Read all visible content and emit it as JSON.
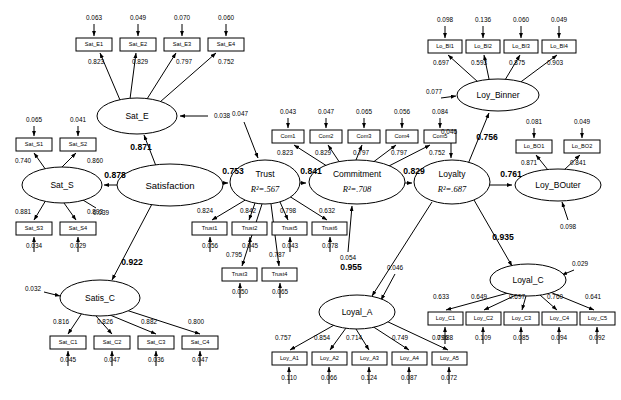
{
  "diagram": {
    "type": "sem-path-diagram",
    "title": "",
    "background_color": "#ffffff",
    "line_color": "#000000"
  },
  "latent_variables": [
    {
      "id": "Sat_E",
      "label": "Sat_E",
      "r2": "",
      "cx": 137,
      "cy": 116,
      "rx": 40,
      "ry": 18
    },
    {
      "id": "Sat_S",
      "label": "Sat_S",
      "r2": "",
      "cx": 62,
      "cy": 185,
      "rx": 40,
      "ry": 18
    },
    {
      "id": "Satisfaction",
      "label": "Satisfaction",
      "r2": "",
      "cx": 170,
      "cy": 185,
      "rx": 53,
      "ry": 21
    },
    {
      "id": "Satis_C",
      "label": "Satis_C",
      "r2": "",
      "cx": 100,
      "cy": 298,
      "rx": 40,
      "ry": 18
    },
    {
      "id": "Trust",
      "label": "Trust",
      "r2": "R²=.567",
      "cx": 265,
      "cy": 182,
      "rx": 35,
      "ry": 22
    },
    {
      "id": "Commitment",
      "label": "Commitment",
      "r2": "R²=.708",
      "cx": 357,
      "cy": 182,
      "rx": 48,
      "ry": 22
    },
    {
      "id": "Loyalty",
      "label": "Loyalty",
      "r2": "R²=.687",
      "cx": 452,
      "cy": 182,
      "rx": 38,
      "ry": 22
    },
    {
      "id": "Loy_Binner",
      "label": "Loy_Binner",
      "r2": "",
      "cx": 498,
      "cy": 95,
      "rx": 41,
      "ry": 16
    },
    {
      "id": "Loy_BOuter",
      "label": "Loy_BOuter",
      "r2": "",
      "cx": 558,
      "cy": 185,
      "rx": 43,
      "ry": 16
    },
    {
      "id": "Loyal_C",
      "label": "Loyal_C",
      "r2": "",
      "cx": 528,
      "cy": 280,
      "rx": 38,
      "ry": 16
    },
    {
      "id": "Loyal_A",
      "label": "Loyal_A",
      "r2": "",
      "cx": 357,
      "cy": 312,
      "rx": 38,
      "ry": 17
    }
  ],
  "measured_variables": [
    {
      "id": "Sat_E1",
      "label": "Sat_E1",
      "x": 76,
      "y": 38,
      "w": 36,
      "h": 13
    },
    {
      "id": "Sat_E2",
      "label": "Sat_E2",
      "x": 120,
      "y": 38,
      "w": 36,
      "h": 13
    },
    {
      "id": "Sat_E3",
      "label": "Sat_E3",
      "x": 164,
      "y": 38,
      "w": 36,
      "h": 13
    },
    {
      "id": "Sat_E4",
      "label": "Sat_E4",
      "x": 208,
      "y": 38,
      "w": 36,
      "h": 13
    },
    {
      "id": "Sat_S1",
      "label": "Sat_S1",
      "x": 16,
      "y": 138,
      "w": 36,
      "h": 13
    },
    {
      "id": "Sat_S2",
      "label": "Sat_S2",
      "x": 60,
      "y": 138,
      "w": 36,
      "h": 13
    },
    {
      "id": "Sat_S3",
      "label": "Sat_S3",
      "x": 16,
      "y": 222,
      "w": 36,
      "h": 13
    },
    {
      "id": "Sat_S4",
      "label": "Sat_S4",
      "x": 60,
      "y": 222,
      "w": 36,
      "h": 13
    },
    {
      "id": "Sat_C1",
      "label": "Sat_C1",
      "x": 50,
      "y": 336,
      "w": 36,
      "h": 13
    },
    {
      "id": "Sat_C2",
      "label": "Sat_C2",
      "x": 94,
      "y": 336,
      "w": 36,
      "h": 13
    },
    {
      "id": "Sat_C3",
      "label": "Sat_C3",
      "x": 138,
      "y": 336,
      "w": 36,
      "h": 13
    },
    {
      "id": "Sat_C4",
      "label": "Sat_C4",
      "x": 182,
      "y": 336,
      "w": 36,
      "h": 13
    },
    {
      "id": "Trust1",
      "label": "Trust1",
      "x": 192,
      "y": 222,
      "w": 35,
      "h": 13
    },
    {
      "id": "Trust2",
      "label": "Trust2",
      "x": 232,
      "y": 222,
      "w": 35,
      "h": 13
    },
    {
      "id": "Trust3",
      "label": "Trust3",
      "x": 222,
      "y": 268,
      "w": 35,
      "h": 13
    },
    {
      "id": "Trust4",
      "label": "Trust4",
      "x": 262,
      "y": 268,
      "w": 35,
      "h": 13
    },
    {
      "id": "Trust5",
      "label": "Trust5",
      "x": 272,
      "y": 222,
      "w": 35,
      "h": 13
    },
    {
      "id": "Trust6",
      "label": "Trust6",
      "x": 312,
      "y": 222,
      "w": 35,
      "h": 13
    },
    {
      "id": "Com1",
      "label": "Com1",
      "x": 272,
      "y": 130,
      "w": 32,
      "h": 13
    },
    {
      "id": "Com2",
      "label": "Com2",
      "x": 310,
      "y": 130,
      "w": 32,
      "h": 13
    },
    {
      "id": "Com3",
      "label": "Com3",
      "x": 348,
      "y": 130,
      "w": 32,
      "h": 13
    },
    {
      "id": "Com4",
      "label": "Com4",
      "x": 386,
      "y": 130,
      "w": 32,
      "h": 13
    },
    {
      "id": "Com5",
      "label": "Com5",
      "x": 424,
      "y": 130,
      "w": 32,
      "h": 13
    },
    {
      "id": "Lo_BI1",
      "label": "Lo_BI1",
      "x": 428,
      "y": 40,
      "w": 34,
      "h": 13
    },
    {
      "id": "Lo_BI2",
      "label": "Lo_BI2",
      "x": 466,
      "y": 40,
      "w": 34,
      "h": 13
    },
    {
      "id": "Lo_BI3",
      "label": "Lo_BI3",
      "x": 504,
      "y": 40,
      "w": 34,
      "h": 13
    },
    {
      "id": "Lo_BI4",
      "label": "Lo_BI4",
      "x": 542,
      "y": 40,
      "w": 34,
      "h": 13
    },
    {
      "id": "Lo_BO1",
      "label": "Lo_BO1",
      "x": 516,
      "y": 140,
      "w": 36,
      "h": 13
    },
    {
      "id": "Lo_BO2",
      "label": "Lo_BO2",
      "x": 564,
      "y": 140,
      "w": 36,
      "h": 13
    },
    {
      "id": "Loy_C1",
      "label": "Loy_C1",
      "x": 428,
      "y": 312,
      "w": 35,
      "h": 13
    },
    {
      "id": "Loy_C2",
      "label": "Loy_C2",
      "x": 466,
      "y": 312,
      "w": 35,
      "h": 13
    },
    {
      "id": "Loy_C3",
      "label": "Loy_C3",
      "x": 504,
      "y": 312,
      "w": 35,
      "h": 13
    },
    {
      "id": "Loy_C4",
      "label": "Loy_C4",
      "x": 542,
      "y": 312,
      "w": 35,
      "h": 13
    },
    {
      "id": "Loy_C5",
      "label": "Loy_C5",
      "x": 580,
      "y": 312,
      "w": 35,
      "h": 13
    },
    {
      "id": "Loy_A1",
      "label": "Loy_A1",
      "x": 272,
      "y": 352,
      "w": 35,
      "h": 13
    },
    {
      "id": "Loy_A2",
      "label": "Loy_A2",
      "x": 312,
      "y": 352,
      "w": 35,
      "h": 13
    },
    {
      "id": "Loy_A3",
      "label": "Loy_A3",
      "x": 352,
      "y": 352,
      "w": 35,
      "h": 13
    },
    {
      "id": "Loy_A4",
      "label": "Loy_A4",
      "x": 392,
      "y": 352,
      "w": 35,
      "h": 13
    },
    {
      "id": "Loy_A5",
      "label": "Loy_A5",
      "x": 432,
      "y": 352,
      "w": 35,
      "h": 13
    }
  ],
  "structural_paths": [
    {
      "id": "satisfaction-to-sat_e",
      "value": "0.871",
      "lx": 141,
      "ly": 148
    },
    {
      "id": "satisfaction-to-sat_s",
      "value": "0.878",
      "lx": 115,
      "ly": 176
    },
    {
      "id": "satisfaction-to-satis_c",
      "value": "0.922",
      "lx": 132,
      "ly": 263
    },
    {
      "id": "satisfaction-to-trust",
      "value": "0.753",
      "lx": 233,
      "ly": 172
    },
    {
      "id": "trust-to-commitment",
      "value": "0.841",
      "lx": 311,
      "ly": 172
    },
    {
      "id": "commitment-to-loyalty",
      "value": "0.829",
      "lx": 414,
      "ly": 172
    },
    {
      "id": "loyalty-to-loy_binner",
      "value": "0.756",
      "lx": 487,
      "ly": 138
    },
    {
      "id": "loyalty-to-loy_bouter",
      "value": "0.761",
      "lx": 511,
      "ly": 175
    },
    {
      "id": "loyalty-to-loyal_c",
      "value": "0.935",
      "lx": 503,
      "ly": 238
    },
    {
      "id": "loyalty-to-loyal_a",
      "value": "0.955",
      "lx": 351,
      "ly": 268
    }
  ],
  "loadings": [
    {
      "id": "sat_e-sat_e1",
      "value": "0.823",
      "lx": 96,
      "ly": 62
    },
    {
      "id": "sat_e-sat_e2",
      "value": "0.829",
      "lx": 140,
      "ly": 62
    },
    {
      "id": "sat_e-sat_e3",
      "value": "0.797",
      "lx": 184,
      "ly": 62
    },
    {
      "id": "sat_e-sat_e4",
      "value": "0.752",
      "lx": 226,
      "ly": 62
    },
    {
      "id": "sat_s-sat_s1",
      "value": "0.740",
      "lx": 23,
      "ly": 161
    },
    {
      "id": "sat_s-sat_s2",
      "value": "0.860",
      "lx": 95,
      "ly": 161
    },
    {
      "id": "sat_s-sat_s3",
      "value": "0.881",
      "lx": 23,
      "ly": 212
    },
    {
      "id": "sat_s-sat_s4",
      "value": "0.893",
      "lx": 95,
      "ly": 212
    },
    {
      "id": "satis_c-sat_c1",
      "value": "0.816",
      "lx": 61,
      "ly": 322
    },
    {
      "id": "satis_c-sat_c2",
      "value": "0.826",
      "lx": 105,
      "ly": 322
    },
    {
      "id": "satis_c-sat_c3",
      "value": "0.882",
      "lx": 149,
      "ly": 322
    },
    {
      "id": "satis_c-sat_c4",
      "value": "0.800",
      "lx": 196,
      "ly": 322
    },
    {
      "id": "trust-trust1",
      "value": "0.824",
      "lx": 205,
      "ly": 211
    },
    {
      "id": "trust-trust2",
      "value": "0.842",
      "lx": 248,
      "ly": 211
    },
    {
      "id": "trust-trust3",
      "value": "0.795",
      "lx": 234,
      "ly": 255
    },
    {
      "id": "trust-trust4",
      "value": "0.787",
      "lx": 277,
      "ly": 255
    },
    {
      "id": "trust-trust5",
      "value": "0.798",
      "lx": 288,
      "ly": 211
    },
    {
      "id": "trust-trust6",
      "value": "0.632",
      "lx": 327,
      "ly": 211
    },
    {
      "id": "commitment-com1",
      "value": "0.823",
      "lx": 285,
      "ly": 153
    },
    {
      "id": "commitment-com2",
      "value": "0.829",
      "lx": 323,
      "ly": 153
    },
    {
      "id": "commitment-com3",
      "value": "0.797",
      "lx": 361,
      "ly": 153
    },
    {
      "id": "commitment-com4",
      "value": "0.797",
      "lx": 399,
      "ly": 153
    },
    {
      "id": "commitment-com5",
      "value": "0.752",
      "lx": 437,
      "ly": 153
    },
    {
      "id": "loy_binner-lo_bi1",
      "value": "0.697",
      "lx": 441,
      "ly": 63
    },
    {
      "id": "loy_binner-lo_bi2",
      "value": "0.593",
      "lx": 479,
      "ly": 63
    },
    {
      "id": "loy_binner-lo_bi3",
      "value": "0.875",
      "lx": 517,
      "ly": 63
    },
    {
      "id": "loy_binner-lo_bi4",
      "value": "0.903",
      "lx": 555,
      "ly": 63
    },
    {
      "id": "loy_bouter-lo_bo1",
      "value": "0.871",
      "lx": 529,
      "ly": 163
    },
    {
      "id": "loy_bouter-lo_bo2",
      "value": "0.841",
      "lx": 578,
      "ly": 163
    },
    {
      "id": "loyal_c-loy_c1",
      "value": "0.633",
      "lx": 441,
      "ly": 297
    },
    {
      "id": "loyal_c-loy_c2",
      "value": "0.649",
      "lx": 479,
      "ly": 297
    },
    {
      "id": "loyal_c-loy_c3",
      "value": "0.697",
      "lx": 517,
      "ly": 297
    },
    {
      "id": "loyal_c-loy_c4",
      "value": "0.760",
      "lx": 555,
      "ly": 297
    },
    {
      "id": "loyal_c-loy_c5",
      "value": "0.641",
      "lx": 593,
      "ly": 297
    },
    {
      "id": "loyal_a-loy_a1",
      "value": "0.757",
      "lx": 283,
      "ly": 338
    },
    {
      "id": "loyal_a-loy_a2",
      "value": "0.854",
      "lx": 322,
      "ly": 338
    },
    {
      "id": "loyal_a-loy_a3",
      "value": "0.714",
      "lx": 354,
      "ly": 338
    },
    {
      "id": "loyal_a-loy_a4",
      "value": "0.749",
      "lx": 400,
      "ly": 338
    },
    {
      "id": "loyal_a-loy_a5",
      "value": "0.796",
      "lx": 440,
      "ly": 338
    }
  ],
  "error_terms": [
    {
      "id": "e-sat_e1",
      "value": "0.063",
      "lx": 94,
      "ly": 18
    },
    {
      "id": "e-sat_e2",
      "value": "0.049",
      "lx": 138,
      "ly": 18
    },
    {
      "id": "e-sat_e3",
      "value": "0.070",
      "lx": 182,
      "ly": 18
    },
    {
      "id": "e-sat_e4",
      "value": "0.060",
      "lx": 226,
      "ly": 18
    },
    {
      "id": "e-sat_e",
      "value": "0.038",
      "lx": 222,
      "ly": 116
    },
    {
      "id": "e-sat_s1",
      "value": "0.065",
      "lx": 34,
      "ly": 120
    },
    {
      "id": "e-sat_s2",
      "value": "0.041",
      "lx": 78,
      "ly": 120
    },
    {
      "id": "e-sat_s3",
      "value": "0.034",
      "lx": 34,
      "ly": 246
    },
    {
      "id": "e-sat_s4",
      "value": "0.029",
      "lx": 78,
      "ly": 246
    },
    {
      "id": "e-sat_s",
      "value": "0.039",
      "lx": 101,
      "ly": 213
    },
    {
      "id": "e-sat_c1",
      "value": "0.045",
      "lx": 68,
      "ly": 360
    },
    {
      "id": "e-sat_c2",
      "value": "0.047",
      "lx": 112,
      "ly": 360
    },
    {
      "id": "e-sat_c3",
      "value": "0.036",
      "lx": 156,
      "ly": 360
    },
    {
      "id": "e-sat_c4",
      "value": "0.047",
      "lx": 200,
      "ly": 360
    },
    {
      "id": "e-satis_c",
      "value": "0.032",
      "lx": 33,
      "ly": 289
    },
    {
      "id": "e-trust1",
      "value": "0.056",
      "lx": 210,
      "ly": 246
    },
    {
      "id": "e-trust2",
      "value": "0.045",
      "lx": 250,
      "ly": 246
    },
    {
      "id": "e-trust3",
      "value": "0.050",
      "lx": 240,
      "ly": 292
    },
    {
      "id": "e-trust4",
      "value": "0.065",
      "lx": 280,
      "ly": 292
    },
    {
      "id": "e-trust5",
      "value": "0.043",
      "lx": 290,
      "ly": 246
    },
    {
      "id": "e-trust6",
      "value": "0.078",
      "lx": 330,
      "ly": 246
    },
    {
      "id": "e-trust",
      "value": "0.047",
      "lx": 240,
      "ly": 114
    },
    {
      "id": "e-com1",
      "value": "0.043",
      "lx": 288,
      "ly": 112
    },
    {
      "id": "e-com2",
      "value": "0.047",
      "lx": 326,
      "ly": 112
    },
    {
      "id": "e-com3",
      "value": "0.065",
      "lx": 364,
      "ly": 112
    },
    {
      "id": "e-com4",
      "value": "0.056",
      "lx": 402,
      "ly": 112
    },
    {
      "id": "e-com5",
      "value": "0.084",
      "lx": 440,
      "ly": 112
    },
    {
      "id": "e-commitment",
      "value": "0.054",
      "lx": 348,
      "ly": 258
    },
    {
      "id": "e-lo_bi1",
      "value": "0.098",
      "lx": 445,
      "ly": 20
    },
    {
      "id": "e-lo_bi2",
      "value": "0.136",
      "lx": 483,
      "ly": 20
    },
    {
      "id": "e-lo_bi3",
      "value": "0.060",
      "lx": 521,
      "ly": 20
    },
    {
      "id": "e-lo_bi4",
      "value": "0.049",
      "lx": 559,
      "ly": 20
    },
    {
      "id": "e-loy_binner",
      "value": "0.077",
      "lx": 434,
      "ly": 92
    },
    {
      "id": "e-lo_bo1",
      "value": "0.081",
      "lx": 534,
      "ly": 122
    },
    {
      "id": "e-lo_bo2",
      "value": "0.049",
      "lx": 582,
      "ly": 122
    },
    {
      "id": "e-loy_bouter",
      "value": "0.098",
      "lx": 568,
      "ly": 227
    },
    {
      "id": "e-loyalty",
      "value": "0.046",
      "lx": 449,
      "ly": 132
    },
    {
      "id": "e-loy_c1",
      "value": "0.088",
      "lx": 445,
      "ly": 338
    },
    {
      "id": "e-loy_c2",
      "value": "0.109",
      "lx": 483,
      "ly": 338
    },
    {
      "id": "e-loy_c3",
      "value": "0.085",
      "lx": 521,
      "ly": 338
    },
    {
      "id": "e-loy_c4",
      "value": "0.094",
      "lx": 559,
      "ly": 338
    },
    {
      "id": "e-loy_c5",
      "value": "0.092",
      "lx": 597,
      "ly": 338
    },
    {
      "id": "e-loyal_c",
      "value": "0.029",
      "lx": 580,
      "ly": 264
    },
    {
      "id": "e-loy_a1",
      "value": "0.110",
      "lx": 289,
      "ly": 378
    },
    {
      "id": "e-loy_a2",
      "value": "0.066",
      "lx": 329,
      "ly": 378
    },
    {
      "id": "e-loy_a3",
      "value": "0.124",
      "lx": 369,
      "ly": 378
    },
    {
      "id": "e-loy_a4",
      "value": "0.087",
      "lx": 409,
      "ly": 378
    },
    {
      "id": "e-loy_a5",
      "value": "0.072",
      "lx": 449,
      "ly": 378
    },
    {
      "id": "e-loyal_a",
      "value": "0.046",
      "lx": 395,
      "ly": 268
    }
  ]
}
